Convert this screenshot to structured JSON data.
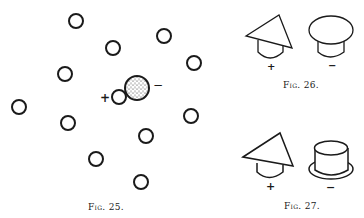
{
  "figures": [
    {
      "id": "fig25",
      "caption": "Fig. 25.",
      "sign_plus": "+",
      "sign_minus": "−",
      "circles": [
        {
          "cx": 76,
          "cy": 21
        },
        {
          "cx": 113,
          "cy": 48
        },
        {
          "cx": 164,
          "cy": 36
        },
        {
          "cx": 194,
          "cy": 63
        },
        {
          "cx": 65,
          "cy": 74
        },
        {
          "cx": 19,
          "cy": 107
        },
        {
          "cx": 68,
          "cy": 123
        },
        {
          "cx": 191,
          "cy": 116
        },
        {
          "cx": 146,
          "cy": 136
        },
        {
          "cx": 96,
          "cy": 159
        },
        {
          "cx": 141,
          "cy": 182
        }
      ],
      "small_charged_circle": {
        "cx": 119,
        "cy": 97
      },
      "large_stippled_circle": {
        "cx": 137,
        "cy": 88
      }
    },
    {
      "id": "fig26",
      "caption": "Fig. 26.",
      "left_sign": "+",
      "right_sign": "−"
    },
    {
      "id": "fig27",
      "caption": "Fig. 27.",
      "left_sign": "+",
      "right_sign": "−"
    }
  ]
}
